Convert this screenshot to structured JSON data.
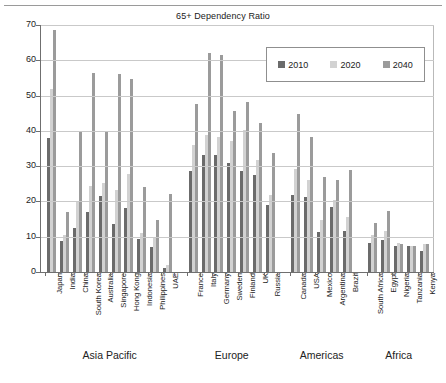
{
  "chart_data": {
    "type": "bar",
    "title": "65+ Dependency Ratio",
    "xlabel": "",
    "ylabel": "",
    "ylim": [
      0,
      70
    ],
    "yticks": [
      0,
      10,
      20,
      30,
      40,
      50,
      60,
      70
    ],
    "grid": true,
    "legend_position": "top-right",
    "legend": [
      "2010",
      "2020",
      "2040"
    ],
    "series": [
      {
        "name": "2010",
        "color": "#6b6b6b",
        "values": [
          38.0,
          8.9,
          12.5,
          16.9,
          21.6,
          13.5,
          18.2,
          9.3,
          7.1,
          1.0,
          28.5,
          33.2,
          33.1,
          30.8,
          28.6,
          27.6,
          19.0,
          21.8,
          21.2,
          11.4,
          18.5,
          11.6,
          8.2,
          9.0,
          7.5,
          7.4,
          5.9
        ]
      },
      {
        "name": "2020",
        "color": "#d2d2d2",
        "values": [
          52.0,
          10.6,
          20.0,
          24.3,
          25.2,
          23.3,
          27.8,
          11.1,
          9.8,
          2.0,
          36.0,
          38.9,
          38.3,
          37.0,
          40.2,
          31.8,
          21.9,
          29.1,
          26.1,
          14.6,
          20.3,
          15.5,
          10.4,
          11.6,
          8.1,
          7.5,
          7.8
        ]
      },
      {
        "name": "2040",
        "color": "#9b9b9b",
        "values": [
          68.5,
          17.0,
          40.0,
          56.3,
          40.0,
          56.0,
          54.7,
          24.1,
          14.8,
          22.1,
          47.7,
          62.0,
          61.4,
          45.5,
          48.1,
          42.3,
          33.8,
          44.8,
          38.4,
          26.9,
          26.1,
          28.9,
          13.9,
          17.3,
          8.0,
          7.5,
          7.8
        ]
      }
    ],
    "categories": [
      "Japan",
      "India",
      "China",
      "South Korea",
      "Australia",
      "Singapore",
      "Hong Kong",
      "Indonesia",
      "Philippines",
      "UAE",
      "France",
      "Italy",
      "Germany",
      "Sweden",
      "Finland",
      "UK",
      "Russia",
      "Canada",
      "USA",
      "Mexico",
      "Argentina",
      "Brazil",
      "South Africa",
      "Egypt",
      "Nigeria",
      "Tanzania",
      "Kenya"
    ],
    "groups": [
      {
        "label": "Asia Pacific",
        "start": 0,
        "count": 10
      },
      {
        "label": "Europe",
        "start": 10,
        "count": 7
      },
      {
        "label": "Americas",
        "start": 17,
        "count": 5
      },
      {
        "label": "Africa",
        "start": 22,
        "count": 5
      }
    ]
  }
}
